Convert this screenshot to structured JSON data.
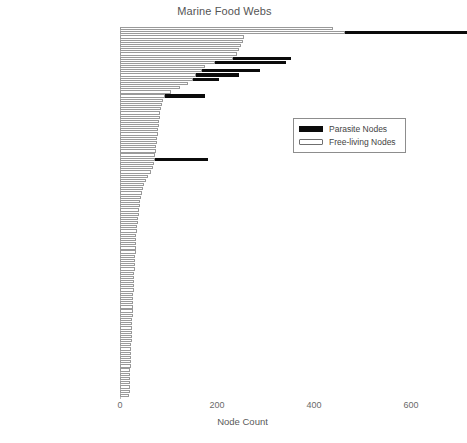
{
  "chart_data": {
    "type": "bar",
    "orientation": "horizontal",
    "stacked": true,
    "title": "Marine Food Webs",
    "xlabel": "Node Count",
    "ylabel": "",
    "xlim": [
      0,
      660
    ],
    "xticks": [
      0,
      200,
      400,
      600
    ],
    "xticklabels": [
      "0",
      "200",
      "400",
      "600"
    ],
    "grid": false,
    "legend": {
      "position": "center-right",
      "entries": [
        {
          "name": "Parasite Nodes",
          "swatch": "filled-black"
        },
        {
          "name": "Free-living Nodes",
          "swatch": "outlined-white"
        }
      ]
    },
    "series": [
      {
        "name": "Free-living Nodes",
        "color": "#ffffff",
        "edgecolor": "#9a9a9a"
      },
      {
        "name": "Parasite Nodes",
        "color": "#0b0b0b",
        "edgecolor": "#0b0b0b"
      }
    ],
    "bottom_note": "50 webs with <20 nodes",
    "rows": [
      {
        "label": "",
        "free": 440,
        "parasite": 0
      },
      {
        "label": "Palmyra Sand Flats",
        "free": 465,
        "parasite": 250
      },
      {
        "label": "",
        "free": 255,
        "parasite": 0
      },
      {
        "label": "",
        "free": 253,
        "parasite": 0
      },
      {
        "label": "",
        "free": 250,
        "parasite": 0
      },
      {
        "label": "",
        "free": 245,
        "parasite": 0
      },
      {
        "label": "",
        "free": 242,
        "parasite": 0
      },
      {
        "label": "Estero Punta Banda",
        "free": 233,
        "parasite": 120
      },
      {
        "label": "Bahia Falsa",
        "free": 196,
        "parasite": 147
      },
      {
        "label": "",
        "free": 175,
        "parasite": 0
      },
      {
        "label": "Carpinteria Salt Marsh",
        "free": 170,
        "parasite": 118
      },
      {
        "label": "Sylt Estuary",
        "free": 157,
        "parasite": 88
      },
      {
        "label": "Otago Harbor",
        "free": 151,
        "parasite": 54
      },
      {
        "label": "",
        "free": 140,
        "parasite": 0
      },
      {
        "label": "",
        "free": 124,
        "parasite": 0
      },
      {
        "label": "",
        "free": 105,
        "parasite": 0
      },
      {
        "label": "Ythan Estuary",
        "free": 92,
        "parasite": 84
      },
      {
        "label": "",
        "free": 88,
        "parasite": 0
      },
      {
        "label": "",
        "free": 86,
        "parasite": 0
      },
      {
        "label": "",
        "free": 84,
        "parasite": 0
      },
      {
        "label": "",
        "free": 83,
        "parasite": 0
      },
      {
        "label": "",
        "free": 82,
        "parasite": 0
      },
      {
        "label": "",
        "free": 81,
        "parasite": 0
      },
      {
        "label": "",
        "free": 80,
        "parasite": 0
      },
      {
        "label": "",
        "free": 79,
        "parasite": 0
      },
      {
        "label": "",
        "free": 78,
        "parasite": 0
      },
      {
        "label": "",
        "free": 77,
        "parasite": 0
      },
      {
        "label": "",
        "free": 76,
        "parasite": 0
      },
      {
        "label": "",
        "free": 75,
        "parasite": 0
      },
      {
        "label": "",
        "free": 74,
        "parasite": 0
      },
      {
        "label": "",
        "free": 73,
        "parasite": 0
      },
      {
        "label": "Flensburg Fjord",
        "free": 72,
        "parasite": 110
      },
      {
        "label": "",
        "free": 71,
        "parasite": 0
      },
      {
        "label": "",
        "free": 68,
        "parasite": 0
      },
      {
        "label": "",
        "free": 63,
        "parasite": 0
      },
      {
        "label": "",
        "free": 57,
        "parasite": 0
      },
      {
        "label": "",
        "free": 53,
        "parasite": 0
      },
      {
        "label": "",
        "free": 50,
        "parasite": 0
      },
      {
        "label": "",
        "free": 48,
        "parasite": 0
      },
      {
        "label": "",
        "free": 46,
        "parasite": 0
      },
      {
        "label": "",
        "free": 44,
        "parasite": 0
      },
      {
        "label": "",
        "free": 42,
        "parasite": 0
      },
      {
        "label": "",
        "free": 41,
        "parasite": 0
      },
      {
        "label": "",
        "free": 40,
        "parasite": 0
      },
      {
        "label": "",
        "free": 39,
        "parasite": 0
      },
      {
        "label": "",
        "free": 38,
        "parasite": 0
      },
      {
        "label": "",
        "free": 37,
        "parasite": 0
      },
      {
        "label": "",
        "free": 36,
        "parasite": 0
      },
      {
        "label": "",
        "free": 35,
        "parasite": 0
      },
      {
        "label": "",
        "free": 34,
        "parasite": 0
      },
      {
        "label": "",
        "free": 34,
        "parasite": 0
      },
      {
        "label": "Benguela",
        "free": 33,
        "parasite": 0
      },
      {
        "label": "",
        "free": 32,
        "parasite": 0
      },
      {
        "label": "",
        "free": 32,
        "parasite": 0
      },
      {
        "label": "",
        "free": 31,
        "parasite": 0
      },
      {
        "label": "",
        "free": 31,
        "parasite": 0
      },
      {
        "label": "",
        "free": 30,
        "parasite": 0
      },
      {
        "label": "",
        "free": 30,
        "parasite": 0
      },
      {
        "label": "",
        "free": 29,
        "parasite": 0
      },
      {
        "label": "",
        "free": 29,
        "parasite": 0
      },
      {
        "label": "",
        "free": 28,
        "parasite": 0
      },
      {
        "label": "",
        "free": 28,
        "parasite": 0
      },
      {
        "label": "",
        "free": 28,
        "parasite": 0
      },
      {
        "label": "",
        "free": 27,
        "parasite": 0
      },
      {
        "label": "",
        "free": 27,
        "parasite": 0
      },
      {
        "label": "",
        "free": 27,
        "parasite": 0
      },
      {
        "label": "",
        "free": 26,
        "parasite": 0
      },
      {
        "label": "",
        "free": 26,
        "parasite": 0
      },
      {
        "label": "",
        "free": 26,
        "parasite": 0
      },
      {
        "label": "",
        "free": 25,
        "parasite": 0
      },
      {
        "label": "",
        "free": 25,
        "parasite": 0
      },
      {
        "label": "",
        "free": 25,
        "parasite": 0
      },
      {
        "label": "",
        "free": 24,
        "parasite": 0
      },
      {
        "label": "",
        "free": 24,
        "parasite": 0
      },
      {
        "label": "",
        "free": 24,
        "parasite": 0
      },
      {
        "label": "",
        "free": 23,
        "parasite": 0
      },
      {
        "label": "",
        "free": 23,
        "parasite": 0
      },
      {
        "label": "",
        "free": 23,
        "parasite": 0
      },
      {
        "label": "",
        "free": 22,
        "parasite": 0
      },
      {
        "label": "",
        "free": 22,
        "parasite": 0
      },
      {
        "label": "",
        "free": 22,
        "parasite": 0
      },
      {
        "label": "",
        "free": 21,
        "parasite": 0
      },
      {
        "label": "",
        "free": 21,
        "parasite": 0
      },
      {
        "label": "",
        "free": 21,
        "parasite": 0
      },
      {
        "label": "",
        "free": 20,
        "parasite": 0
      },
      {
        "label": "",
        "free": 20,
        "parasite": 0
      },
      {
        "label": "",
        "free": 20,
        "parasite": 0
      },
      {
        "label": "50 webs with <20 nodes",
        "free": 19,
        "parasite": 0
      }
    ]
  }
}
